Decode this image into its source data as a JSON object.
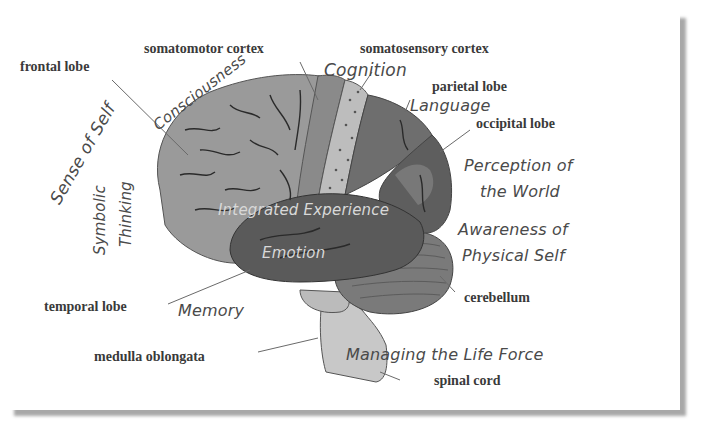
{
  "diagram": {
    "anatomical_labels": {
      "frontal_lobe": "frontal lobe",
      "somatomotor_cortex": "somatomotor cortex",
      "somatosensory_cortex": "somatosensory cortex",
      "parietal_lobe": "parietal lobe",
      "occipital_lobe": "occipital lobe",
      "temporal_lobe": "temporal lobe",
      "cerebellum": "cerebellum",
      "medulla_oblongata": "medulla oblongata",
      "spinal_cord": "spinal cord"
    },
    "function_labels": {
      "consciousness": "Consciousness",
      "sense_of_self": "Sense of Self",
      "symbolic": "Symbolic",
      "thinking": "Thinking",
      "cognition": "Cognition",
      "language": "Language",
      "perception_line1": "Perception of",
      "perception_line2": "the World",
      "integrated_experience": "Integrated Experience",
      "emotion": "Emotion",
      "awareness_line1": "Awareness of",
      "awareness_line2": "Physical Self",
      "memory": "Memory",
      "managing_life_force": "Managing the Life Force"
    },
    "colors": {
      "frontal": "#9a9a9a",
      "motor_strip": "#8a8a8a",
      "sensory_strip": "#bdbdbd",
      "parietal": "#6e6e6e",
      "occipital": "#5e5e5e",
      "temporal": "#5a5a5a",
      "cerebellum": "#7a7a7a",
      "brainstem": "#c8c8c8",
      "sulci": "#2a2a2a",
      "leader_line": "#6a6a6a"
    }
  }
}
